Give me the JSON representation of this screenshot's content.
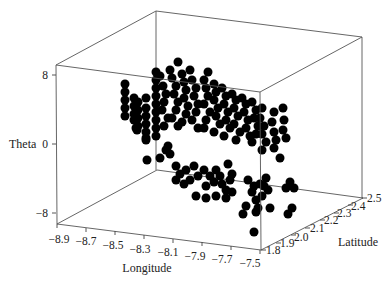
{
  "chart_data": {
    "type": "scatter",
    "subtype": "3d-scatter",
    "title": "",
    "xlabel": "Longitude",
    "ylabel": "Latitude",
    "zlabel": "Theta",
    "xlim": [
      -8.9,
      -7.5
    ],
    "ylim": [
      1.8,
      2.5
    ],
    "zlim": [
      -8,
      8
    ],
    "x_ticks": [
      "-8.9",
      "-8.7",
      "-8.5",
      "-8.3",
      "-8.1",
      "-7.9",
      "-7.7",
      "-7.5"
    ],
    "y_ticks": [
      "1.8",
      "1.9",
      "2.0",
      "2.1",
      "2.2",
      "2.3",
      "2.4",
      "2.5"
    ],
    "z_ticks": [
      "8",
      "0",
      "-8"
    ],
    "marker": {
      "shape": "circle",
      "color": "#000000",
      "size": 9
    },
    "grid": false,
    "legend": null,
    "points_screen": [
      [
        125,
        84
      ],
      [
        125,
        92
      ],
      [
        125,
        100
      ],
      [
        125,
        108
      ],
      [
        125,
        116
      ],
      [
        134,
        98
      ],
      [
        134,
        106
      ],
      [
        134,
        114
      ],
      [
        134,
        120
      ],
      [
        138,
        102
      ],
      [
        138,
        110
      ],
      [
        138,
        118
      ],
      [
        138,
        126
      ],
      [
        146,
        98
      ],
      [
        146,
        108
      ],
      [
        146,
        116
      ],
      [
        146,
        124
      ],
      [
        146,
        132
      ],
      [
        146,
        138
      ],
      [
        137,
        130
      ],
      [
        136,
        128
      ],
      [
        146,
        140
      ],
      [
        156,
        72
      ],
      [
        156,
        80
      ],
      [
        156,
        88
      ],
      [
        156,
        96
      ],
      [
        156,
        104
      ],
      [
        156,
        112
      ],
      [
        156,
        120
      ],
      [
        156,
        128
      ],
      [
        156,
        136
      ],
      [
        160,
        76
      ],
      [
        163,
        86
      ],
      [
        166,
        94
      ],
      [
        164,
        102
      ],
      [
        162,
        110
      ],
      [
        168,
        118
      ],
      [
        164,
        126
      ],
      [
        170,
        70
      ],
      [
        172,
        78
      ],
      [
        176,
        86
      ],
      [
        174,
        94
      ],
      [
        178,
        102
      ],
      [
        176,
        110
      ],
      [
        172,
        118
      ],
      [
        178,
        126
      ],
      [
        178,
        62
      ],
      [
        182,
        74
      ],
      [
        184,
        82
      ],
      [
        186,
        90
      ],
      [
        184,
        98
      ],
      [
        188,
        106
      ],
      [
        186,
        114
      ],
      [
        182,
        122
      ],
      [
        190,
        70
      ],
      [
        192,
        80
      ],
      [
        196,
        88
      ],
      [
        194,
        96
      ],
      [
        198,
        104
      ],
      [
        196,
        112
      ],
      [
        192,
        120
      ],
      [
        198,
        128
      ],
      [
        204,
        80
      ],
      [
        206,
        88
      ],
      [
        208,
        96
      ],
      [
        204,
        104
      ],
      [
        210,
        112
      ],
      [
        206,
        120
      ],
      [
        204,
        128
      ],
      [
        208,
        72
      ],
      [
        214,
        84
      ],
      [
        216,
        92
      ],
      [
        214,
        100
      ],
      [
        218,
        108
      ],
      [
        216,
        116
      ],
      [
        220,
        124
      ],
      [
        214,
        132
      ],
      [
        222,
        88
      ],
      [
        226,
        96
      ],
      [
        224,
        104
      ],
      [
        228,
        112
      ],
      [
        226,
        120
      ],
      [
        230,
        128
      ],
      [
        224,
        136
      ],
      [
        232,
        94
      ],
      [
        236,
        100
      ],
      [
        234,
        108
      ],
      [
        238,
        116
      ],
      [
        234,
        124
      ],
      [
        240,
        132
      ],
      [
        236,
        140
      ],
      [
        242,
        98
      ],
      [
        246,
        104
      ],
      [
        244,
        112
      ],
      [
        248,
        120
      ],
      [
        246,
        128
      ],
      [
        250,
        136
      ],
      [
        252,
        102
      ],
      [
        256,
        110
      ],
      [
        254,
        118
      ],
      [
        258,
        126
      ],
      [
        256,
        134
      ],
      [
        252,
        142
      ],
      [
        262,
        108
      ],
      [
        260,
        118
      ],
      [
        264,
        126
      ],
      [
        262,
        134
      ],
      [
        266,
        142
      ],
      [
        262,
        150
      ],
      [
        274,
        112
      ],
      [
        272,
        122
      ],
      [
        274,
        132
      ],
      [
        276,
        140
      ],
      [
        274,
        148
      ],
      [
        280,
        158
      ],
      [
        283,
        108
      ],
      [
        284,
        120
      ],
      [
        283,
        130
      ],
      [
        286,
        138
      ],
      [
        168,
        146
      ],
      [
        170,
        154
      ],
      [
        160,
        158
      ],
      [
        166,
        150
      ],
      [
        147,
        160
      ],
      [
        176,
        166
      ],
      [
        180,
        174
      ],
      [
        186,
        170
      ],
      [
        194,
        166
      ],
      [
        198,
        176
      ],
      [
        190,
        180
      ],
      [
        184,
        184
      ],
      [
        176,
        180
      ],
      [
        204,
        170
      ],
      [
        210,
        176
      ],
      [
        216,
        170
      ],
      [
        214,
        182
      ],
      [
        206,
        186
      ],
      [
        220,
        176
      ],
      [
        222,
        184
      ],
      [
        228,
        164
      ],
      [
        232,
        174
      ],
      [
        230,
        180
      ],
      [
        226,
        190
      ],
      [
        196,
        196
      ],
      [
        206,
        198
      ],
      [
        216,
        196
      ],
      [
        226,
        198
      ],
      [
        232,
        192
      ],
      [
        248,
        180
      ],
      [
        254,
        186
      ],
      [
        260,
        184
      ],
      [
        252,
        192
      ],
      [
        264,
        186
      ],
      [
        266,
        178
      ],
      [
        256,
        200
      ],
      [
        258,
        208
      ],
      [
        262,
        196
      ],
      [
        268,
        190
      ],
      [
        243,
        214
      ],
      [
        246,
        206
      ],
      [
        256,
        212
      ],
      [
        270,
        208
      ],
      [
        286,
        188
      ],
      [
        290,
        182
      ],
      [
        294,
        188
      ],
      [
        292,
        208
      ],
      [
        288,
        214
      ],
      [
        254,
        232
      ]
    ]
  },
  "labels": {
    "z_axis_title": "Theta",
    "x_axis_title": "Longitude",
    "y_axis_title": "Latitude",
    "z_tick_8": "8",
    "z_tick_0": "0",
    "z_tick_neg8": "−8",
    "x_tick_0": "−8.9",
    "x_tick_1": "−8.7",
    "x_tick_2": "−8.5",
    "x_tick_3": "−8.3",
    "x_tick_4": "−8.1",
    "x_tick_5": "−7.9",
    "x_tick_6": "−7.7",
    "x_tick_7": "−7.5",
    "y_tick_0": "1.8",
    "y_tick_1": "1.9",
    "y_tick_2": "2.0",
    "y_tick_3": "2.1",
    "y_tick_4": "2.2",
    "y_tick_5": "2.3",
    "y_tick_6": "2.4",
    "y_tick_7": "2.5"
  }
}
